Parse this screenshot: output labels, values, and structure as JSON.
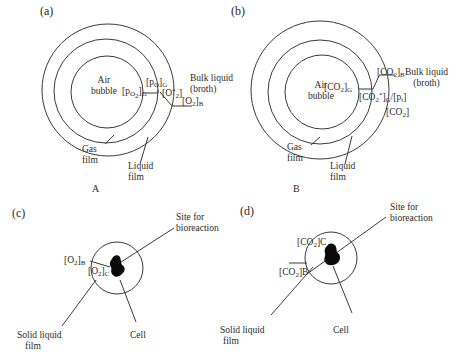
{
  "panels": {
    "a": {
      "tag": "(a)",
      "caption": "A",
      "air_bubble": [
        "Air",
        "bubble"
      ],
      "pO2_G": "[p",
      "pO2_G_sub": "O",
      "pO2_G_sub2": "2",
      "pO2_G_end": "]",
      "pO2_G_subG": "G",
      "pOi_G": "[p",
      "pOi_G_sub": "O",
      "pOi_G_end": "]",
      "pOi_G_subG": "G",
      "O2_star": "[O",
      "O2_star_sup": "*",
      "O2_star_sub": "2",
      "O2_star_end": "]",
      "O2_B": "[O",
      "O2_B_sub": "2",
      "O2_B_end": "]",
      "O2_B_subB": "B",
      "bulk_liquid": [
        "Bulk liquid",
        "(broth)"
      ],
      "gas_film": [
        "Gas",
        "film"
      ],
      "liquid_film": [
        "Liquid",
        "film"
      ]
    },
    "b": {
      "tag": "(b)",
      "caption": "B",
      "air_bubble": [
        "Air",
        "bubble"
      ],
      "CO2_G": "[CO",
      "CO2_G_sub": "2",
      "CO2_G_end": "]",
      "CO2_G_subG": "G",
      "CO2_B": "[CO",
      "CO2_B_sub": "2",
      "CO2_B_end": "]",
      "CO2_B_subB": "B",
      "CO2_star": "[CO",
      "CO2_star_sub": "2",
      "CO2_star_sup": "*",
      "CO2_star_mid": "]",
      "CO2_star_subG": "G",
      "CO2_star_tail": "/[p",
      "CO2_star_tail_sub": "t",
      "CO2_star_tail_end": "]",
      "CO2_plain": "[CO",
      "CO2_plain_sub": "2",
      "CO2_plain_end": "]",
      "bulk_liquid": [
        "Bulk liquid",
        "(broth)"
      ],
      "gas_film": [
        "Gas",
        "film"
      ],
      "liquid_film": [
        "Liquid",
        "film"
      ]
    },
    "c": {
      "tag": "(c)",
      "O2_B": "[O",
      "O2_B_sub": "2",
      "O2_B_end": "]",
      "O2_B_subB": "B",
      "O2_C": "[O",
      "O2_C_sub": "2",
      "O2_C_end": "]",
      "O2_C_subC": "C",
      "site": [
        "Site for",
        "bioreaction"
      ],
      "solid_liquid_film": [
        "Solid liquid",
        "film"
      ],
      "cell": "Cell"
    },
    "d": {
      "tag": "(d)",
      "CO2_C": "[CO",
      "CO2_C_sub": "2",
      "CO2_C_end": "]C",
      "CO2_B": "[CO",
      "CO2_B_sub": "2",
      "CO2_B_end": "]B",
      "site": [
        "Site for",
        "bioreaction"
      ],
      "solid_liquid_film": [
        "Solid liquid",
        "film"
      ],
      "cell": "Cell"
    }
  },
  "colors": {
    "line": "#3a3a3a",
    "cell": "#0a0a0a",
    "background": "#ffffff"
  }
}
